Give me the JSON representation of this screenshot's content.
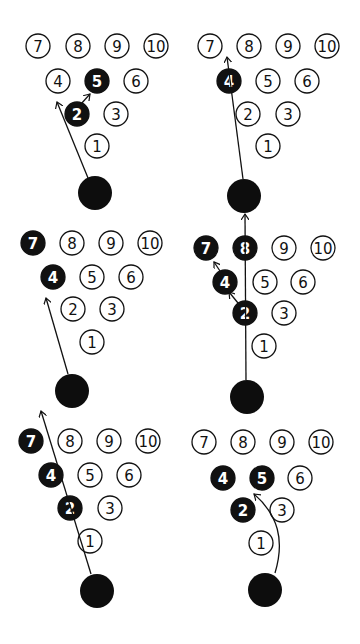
{
  "diagram": {
    "colors": {
      "pin_outline": "#111111",
      "pin_hit": "#111111",
      "ball": "#0d0d0d",
      "background": "#ffffff"
    },
    "pin_radius": 12,
    "ball_radius": 17,
    "panels": [
      {
        "id": "panel-1",
        "pins": [
          {
            "n": "7",
            "x": 38,
            "y": 46,
            "hit": false
          },
          {
            "n": "8",
            "x": 78,
            "y": 46,
            "hit": false
          },
          {
            "n": "9",
            "x": 117,
            "y": 46,
            "hit": false
          },
          {
            "n": "10",
            "x": 156,
            "y": 46,
            "hit": false
          },
          {
            "n": "4",
            "x": 58,
            "y": 81,
            "hit": false
          },
          {
            "n": "5",
            "x": 97,
            "y": 81,
            "hit": true
          },
          {
            "n": "6",
            "x": 136,
            "y": 81,
            "hit": false
          },
          {
            "n": "2",
            "x": 77,
            "y": 114,
            "hit": true
          },
          {
            "n": "3",
            "x": 116,
            "y": 114,
            "hit": false
          },
          {
            "n": "1",
            "x": 97,
            "y": 146,
            "hit": false
          }
        ],
        "ball": {
          "x": 95,
          "y": 193
        },
        "paths": [
          "M 88 178 L 57 102",
          "M 81 104 L 90 94"
        ]
      },
      {
        "id": "panel-2",
        "pins": [
          {
            "n": "7",
            "x": 210,
            "y": 46,
            "hit": false
          },
          {
            "n": "8",
            "x": 249,
            "y": 46,
            "hit": false
          },
          {
            "n": "9",
            "x": 288,
            "y": 46,
            "hit": false
          },
          {
            "n": "10",
            "x": 327,
            "y": 46,
            "hit": false
          },
          {
            "n": "4",
            "x": 229,
            "y": 81,
            "hit": true
          },
          {
            "n": "5",
            "x": 268,
            "y": 81,
            "hit": false
          },
          {
            "n": "6",
            "x": 307,
            "y": 81,
            "hit": false
          },
          {
            "n": "2",
            "x": 248,
            "y": 114,
            "hit": false
          },
          {
            "n": "3",
            "x": 288,
            "y": 114,
            "hit": false
          },
          {
            "n": "1",
            "x": 268,
            "y": 146,
            "hit": false
          }
        ],
        "ball": {
          "x": 244,
          "y": 196
        },
        "paths": [
          "M 243 179 L 227 57"
        ]
      },
      {
        "id": "panel-3",
        "pins": [
          {
            "n": "7",
            "x": 33,
            "y": 243,
            "hit": true
          },
          {
            "n": "8",
            "x": 72,
            "y": 243,
            "hit": false
          },
          {
            "n": "9",
            "x": 111,
            "y": 243,
            "hit": false
          },
          {
            "n": "10",
            "x": 150,
            "y": 243,
            "hit": false
          },
          {
            "n": "4",
            "x": 53,
            "y": 277,
            "hit": true
          },
          {
            "n": "5",
            "x": 92,
            "y": 277,
            "hit": false
          },
          {
            "n": "6",
            "x": 131,
            "y": 277,
            "hit": false
          },
          {
            "n": "2",
            "x": 73,
            "y": 309,
            "hit": false
          },
          {
            "n": "3",
            "x": 112,
            "y": 309,
            "hit": false
          },
          {
            "n": "1",
            "x": 92,
            "y": 342,
            "hit": false
          }
        ],
        "ball": {
          "x": 72,
          "y": 391
        },
        "paths": [
          "M 68 374 L 46 298"
        ]
      },
      {
        "id": "panel-4",
        "pins": [
          {
            "n": "7",
            "x": 206,
            "y": 248,
            "hit": true
          },
          {
            "n": "8",
            "x": 245,
            "y": 248,
            "hit": true
          },
          {
            "n": "9",
            "x": 284,
            "y": 248,
            "hit": false
          },
          {
            "n": "10",
            "x": 323,
            "y": 248,
            "hit": false
          },
          {
            "n": "4",
            "x": 225,
            "y": 282,
            "hit": true
          },
          {
            "n": "5",
            "x": 265,
            "y": 282,
            "hit": false
          },
          {
            "n": "6",
            "x": 303,
            "y": 282,
            "hit": false
          },
          {
            "n": "2",
            "x": 245,
            "y": 313,
            "hit": true
          },
          {
            "n": "3",
            "x": 284,
            "y": 313,
            "hit": false
          },
          {
            "n": "1",
            "x": 264,
            "y": 346,
            "hit": false
          }
        ],
        "ball": {
          "x": 247,
          "y": 397
        },
        "paths": [
          "M 246 380 L 245 214",
          "M 238 303 L 229 292",
          "M 220 271 L 214 262"
        ]
      },
      {
        "id": "panel-5",
        "pins": [
          {
            "n": "7",
            "x": 31,
            "y": 441,
            "hit": true
          },
          {
            "n": "8",
            "x": 70,
            "y": 441,
            "hit": false
          },
          {
            "n": "9",
            "x": 109,
            "y": 441,
            "hit": false
          },
          {
            "n": "10",
            "x": 148,
            "y": 441,
            "hit": false
          },
          {
            "n": "4",
            "x": 51,
            "y": 475,
            "hit": true
          },
          {
            "n": "5",
            "x": 90,
            "y": 475,
            "hit": false
          },
          {
            "n": "6",
            "x": 129,
            "y": 475,
            "hit": false
          },
          {
            "n": "2",
            "x": 70,
            "y": 508,
            "hit": true
          },
          {
            "n": "3",
            "x": 110,
            "y": 508,
            "hit": false
          },
          {
            "n": "1",
            "x": 90,
            "y": 541,
            "hit": false
          }
        ],
        "ball": {
          "x": 97,
          "y": 591
        },
        "paths": [
          "M 91 574 L 41 411"
        ]
      },
      {
        "id": "panel-6",
        "pins": [
          {
            "n": "7",
            "x": 204,
            "y": 442,
            "hit": false
          },
          {
            "n": "8",
            "x": 243,
            "y": 442,
            "hit": false
          },
          {
            "n": "9",
            "x": 282,
            "y": 442,
            "hit": false
          },
          {
            "n": "10",
            "x": 321,
            "y": 442,
            "hit": false
          },
          {
            "n": "4",
            "x": 223,
            "y": 478,
            "hit": true
          },
          {
            "n": "5",
            "x": 262,
            "y": 478,
            "hit": true
          },
          {
            "n": "6",
            "x": 300,
            "y": 478,
            "hit": false
          },
          {
            "n": "2",
            "x": 243,
            "y": 510,
            "hit": true
          },
          {
            "n": "3",
            "x": 282,
            "y": 510,
            "hit": false
          },
          {
            "n": "1",
            "x": 261,
            "y": 543,
            "hit": false
          }
        ],
        "ball": {
          "x": 265,
          "y": 590
        },
        "paths": [
          "M 275 573 C 285 540, 278 515, 254 494"
        ]
      }
    ]
  }
}
